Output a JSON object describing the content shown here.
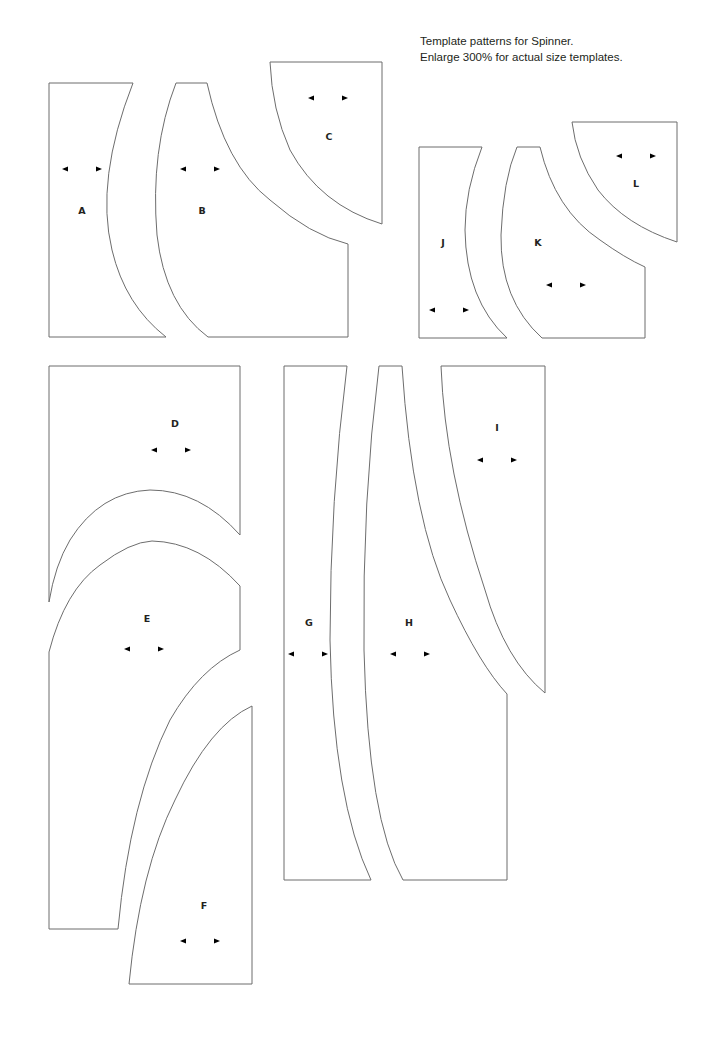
{
  "caption": {
    "line1": "Template patterns for Spinner.",
    "line2": "Enlarge 300% for actual size templates."
  },
  "colors": {
    "background": "#ffffff",
    "outline": "#6d6d6d",
    "text": "#231f20"
  },
  "grain_icon": "double-headed-arrow",
  "pieces": [
    {
      "id": "A",
      "label": "A"
    },
    {
      "id": "B",
      "label": "B"
    },
    {
      "id": "C",
      "label": "C"
    },
    {
      "id": "D",
      "label": "D"
    },
    {
      "id": "E",
      "label": "E"
    },
    {
      "id": "F",
      "label": "F"
    },
    {
      "id": "G",
      "label": "G"
    },
    {
      "id": "H",
      "label": "H"
    },
    {
      "id": "I",
      "label": "I"
    },
    {
      "id": "J",
      "label": "J"
    },
    {
      "id": "K",
      "label": "K"
    },
    {
      "id": "L",
      "label": "L"
    }
  ]
}
